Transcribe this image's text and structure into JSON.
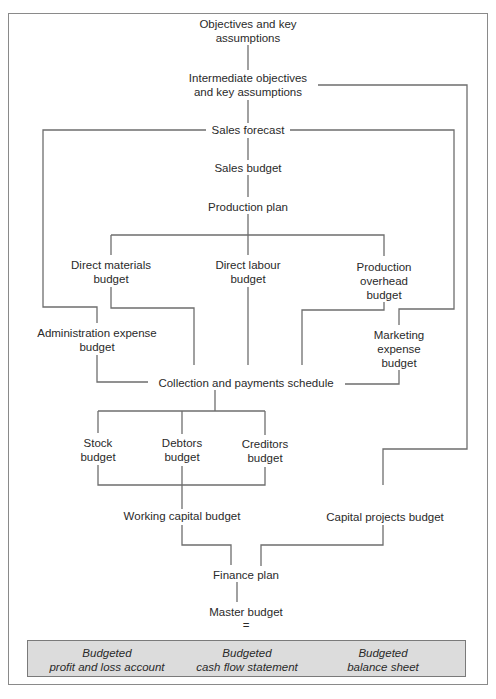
{
  "nodes": {
    "objectives": "Objectives and key\nassumptions",
    "intermediate": "Intermediate objectives\nand key assumptions",
    "sales_forecast": "Sales forecast",
    "sales_budget": "Sales budget",
    "production_plan": "Production plan",
    "direct_materials": "Direct materials\nbudget",
    "direct_labour": "Direct labour\nbudget",
    "production_overhead": "Production overhead\nbudget",
    "administration_expense": "Administration expense\nbudget",
    "marketing_expense": "Marketing expense\nbudget",
    "collection_payments": "Collection and payments schedule",
    "stock": "Stock\nbudget",
    "debtors": "Debtors\nbudget",
    "creditors": "Creditors\nbudget",
    "working_capital": "Working capital budget",
    "capital_projects": "Capital projects budget",
    "finance_plan": "Finance plan",
    "master_budget": "Master budget",
    "equals": "="
  },
  "master_components": [
    "Budgeted\nprofit and loss account",
    "Budgeted\ncash flow statement",
    "Budgeted\nbalance sheet"
  ],
  "colors": {
    "line": "#6e6e6e",
    "box_fill": "#dcdcdc",
    "frame": "#8a8a8a"
  }
}
